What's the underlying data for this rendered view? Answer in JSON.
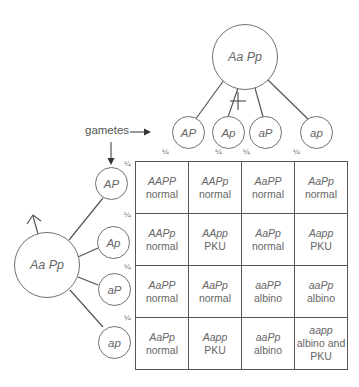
{
  "female_parent": {
    "genotype": "Aa Pp",
    "symbol": "female-symbol"
  },
  "male_parent": {
    "genotype": "Aa Pp",
    "symbol": "male-symbol"
  },
  "gametes_label": "gametes",
  "fraction": "¼",
  "female_gametes": [
    "AP",
    "Ap",
    "aP",
    "ap"
  ],
  "male_gametes": [
    "AP",
    "Ap",
    "aP",
    "ap"
  ],
  "grid": [
    [
      {
        "g": "AAPP",
        "p": "normal"
      },
      {
        "g": "AAPp",
        "p": "normal"
      },
      {
        "g": "AaPP",
        "p": "normal"
      },
      {
        "g": "AaPp",
        "p": "normal"
      }
    ],
    [
      {
        "g": "AAPp",
        "p": "normal"
      },
      {
        "g": "AApp",
        "p": "PKU"
      },
      {
        "g": "AaPp",
        "p": "normal"
      },
      {
        "g": "Aapp",
        "p": "PKU"
      }
    ],
    [
      {
        "g": "AaPP",
        "p": "normal"
      },
      {
        "g": "AaPp",
        "p": "normal"
      },
      {
        "g": "aaPP",
        "p": "albino"
      },
      {
        "g": "aaPp",
        "p": "albino"
      }
    ],
    [
      {
        "g": "AaPp",
        "p": "normal"
      },
      {
        "g": "Aapp",
        "p": "PKU"
      },
      {
        "g": "aaPp",
        "p": "albino"
      },
      {
        "g": "aapp",
        "p": "albino and PKU"
      }
    ]
  ]
}
